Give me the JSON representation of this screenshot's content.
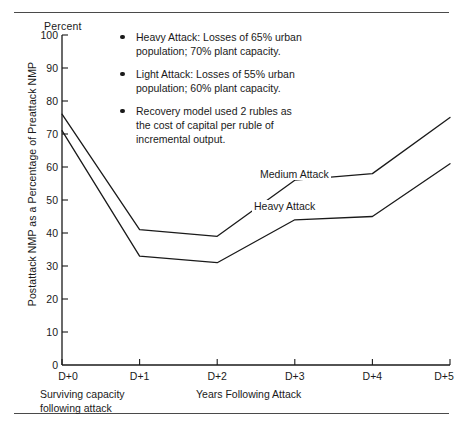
{
  "figure": {
    "y_axis_unit": "Percent",
    "y_axis_title": "Postattack NMP as a Percentage of Preattack NMP",
    "x_caption_left": "Surviving capacity\nfollowing attack",
    "x_caption_middle": "Years Following Attack"
  },
  "annotations": [
    {
      "text": "Heavy Attack:  Losses of 65% urban\npopulation; 70% plant capacity."
    },
    {
      "text": "Light Attack:  Losses of 55% urban\npopulation; 60% plant capacity."
    },
    {
      "text": "Recovery model used 2 rubles as\nthe cost of capital per ruble of\nincremental output."
    }
  ],
  "series_labels": {
    "medium": "Medium Attack",
    "heavy": "Heavy Attack"
  },
  "colors": {
    "line": "#1a1a1a",
    "axis": "#1a1a1a",
    "rule": "#4a4a4a",
    "text": "#1a1a1a"
  },
  "chart_data": {
    "type": "line",
    "title": "",
    "xlabel": "Years Following Attack",
    "ylabel": "Postattack NMP as a Percentage of Preattack NMP",
    "x": [
      "D+0",
      "D+1",
      "D+2",
      "D+3",
      "D+4",
      "D+5"
    ],
    "categories": [
      "D+0",
      "D+1",
      "D+2",
      "D+3",
      "D+4",
      "D+5"
    ],
    "series": [
      {
        "name": "Medium Attack",
        "values": [
          76,
          41,
          39,
          56,
          58,
          75
        ]
      },
      {
        "name": "Heavy Attack",
        "values": [
          71,
          33,
          31,
          44,
          45,
          61
        ]
      }
    ],
    "ylim": [
      0,
      100
    ],
    "yticks": [
      0,
      10,
      20,
      30,
      40,
      50,
      60,
      70,
      80,
      90,
      100
    ],
    "ytick_labels": [
      "0",
      "10",
      "20",
      "30",
      "40",
      "50",
      "60",
      "70",
      "80",
      "90",
      "100"
    ],
    "grid": false,
    "legend": "inline-labels"
  }
}
